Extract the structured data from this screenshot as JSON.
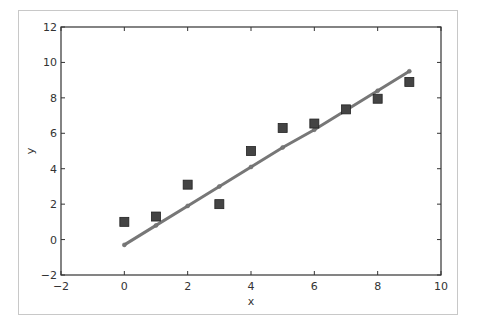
{
  "chart_data": {
    "type": "scatter",
    "title": "",
    "xlabel": "x",
    "ylabel": "y",
    "xlim": [
      -2,
      10
    ],
    "ylim": [
      -2,
      12
    ],
    "xticks": [
      -2,
      0,
      2,
      4,
      6,
      8,
      10
    ],
    "yticks": [
      -2,
      0,
      2,
      4,
      6,
      8,
      10,
      12
    ],
    "xtick_labels": [
      "−2",
      "0",
      "2",
      "4",
      "6",
      "8",
      "10"
    ],
    "ytick_labels": [
      "−2",
      "0",
      "2",
      "4",
      "6",
      "8",
      "10",
      "12"
    ],
    "grid": false,
    "legend": null,
    "series": [
      {
        "name": "data",
        "kind": "scatter",
        "marker": "square",
        "color": "#444444",
        "x": [
          0,
          1,
          2,
          3,
          4,
          5,
          6,
          7,
          8,
          9
        ],
        "y": [
          1.0,
          1.3,
          3.1,
          2.0,
          5.0,
          6.3,
          6.55,
          7.35,
          7.95,
          8.9
        ]
      },
      {
        "name": "fit",
        "kind": "line",
        "marker": "circle",
        "color": "#777777",
        "x": [
          0,
          1,
          2,
          3,
          4,
          5,
          6,
          7,
          8,
          9
        ],
        "y": [
          -0.3,
          0.8,
          1.9,
          3.0,
          4.1,
          5.2,
          6.2,
          7.3,
          8.4,
          9.5
        ]
      }
    ]
  }
}
